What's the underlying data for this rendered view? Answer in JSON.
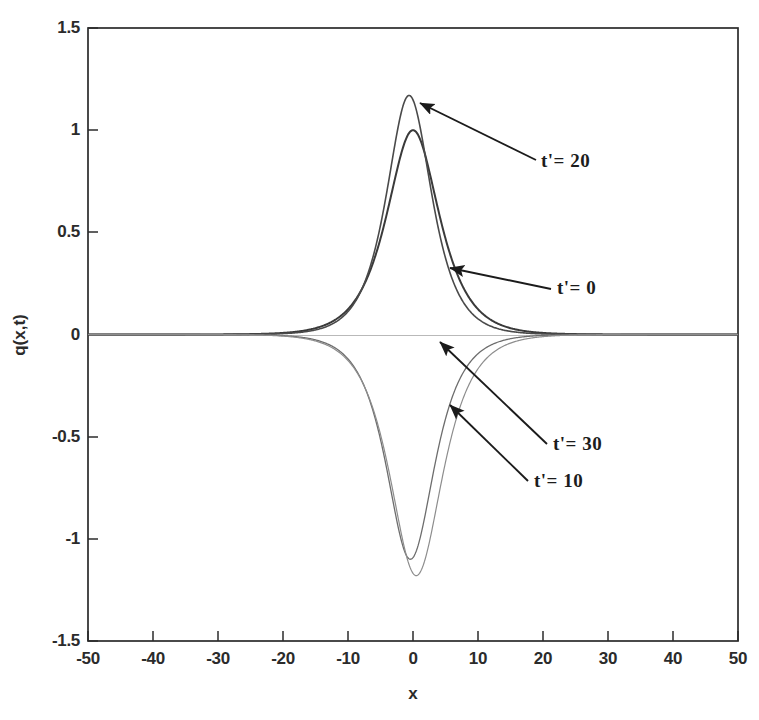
{
  "figure": {
    "background": "#ffffff",
    "frame_color": "#2b2b2b"
  },
  "axes": {
    "x_title": "x",
    "y_title": "q(x,t)",
    "x_ticks": [
      "-50",
      "-40",
      "-30",
      "-20",
      "-10",
      "0",
      "10",
      "20",
      "30",
      "40",
      "50"
    ],
    "y_ticks": [
      "1.5",
      "1",
      "0.5",
      "0",
      "-0.5",
      "-1",
      "-1.5"
    ]
  },
  "annotations": [
    {
      "label": "t'= 20",
      "target_series": "t20"
    },
    {
      "label": "t'= 0",
      "target_series": "t0"
    },
    {
      "label": "t'= 30",
      "target_series": "t30"
    },
    {
      "label": "t'= 10",
      "target_series": "t10"
    }
  ],
  "chart_data": {
    "type": "line",
    "title": "",
    "xlabel": "x",
    "ylabel": "q(x,t)",
    "xlim": [
      -50,
      50
    ],
    "ylim": [
      -1.5,
      1.5
    ],
    "xticks": [
      -50,
      -40,
      -30,
      -20,
      -10,
      0,
      10,
      20,
      30,
      40,
      50
    ],
    "yticks": [
      1.5,
      1,
      0.5,
      0,
      -0.5,
      -1,
      -1.5
    ],
    "grid": false,
    "legend": "annotated arrows on curves",
    "series": [
      {
        "name": "t'= 0",
        "color": "#3a3a3a",
        "linewidth": 2.0,
        "description": "positive sech-shaped pulse, amplitude 1.00, centered at x = 0, half-width ~3.6",
        "amplitude": 1.0,
        "center": 0,
        "width": 3.6,
        "sign": "positive"
      },
      {
        "name": "t'= 20",
        "color": "#4a4a4a",
        "linewidth": 1.6,
        "description": "positive sech-shaped pulse, amplitude 1.17, centered at x = -0.6, slightly narrower",
        "amplitude": 1.17,
        "center": -0.6,
        "width": 3.1,
        "sign": "positive"
      },
      {
        "name": "t'= 10",
        "color": "#6d6d6d",
        "linewidth": 1.3,
        "description": "negative sech-shaped pulse, amplitude -1.10, centered at x = -0.4",
        "amplitude": -1.1,
        "center": -0.4,
        "width": 3.3,
        "sign": "negative"
      },
      {
        "name": "t'= 30",
        "color": "#8d8d8d",
        "linewidth": 1.2,
        "description": "negative sech-shaped pulse, amplitude -1.18, centered at x = 0.5, broader flat shoulders",
        "amplitude": -1.18,
        "center": 0.5,
        "width": 3.6,
        "sign": "negative"
      }
    ],
    "baseline": {
      "value": 0,
      "note": "all curves decay to q = 0 for |x| greater than about 15"
    }
  }
}
